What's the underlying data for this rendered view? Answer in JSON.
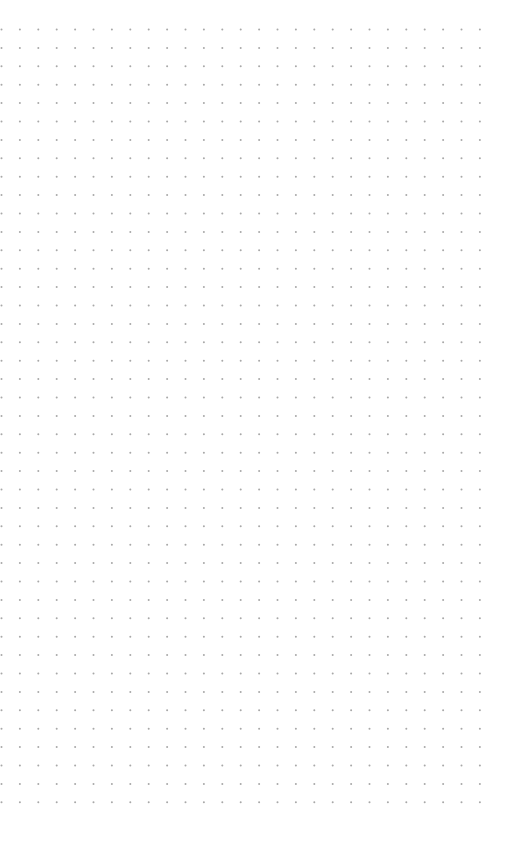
{
  "canvas": {
    "background": "#ffffff",
    "grid": {
      "dot_color": "#a8a8a8",
      "dot_radius": 1,
      "origin_x": 1.5,
      "origin_y": 29.5,
      "spacing_x": 18.4,
      "spacing_y": 18.4,
      "columns": 27,
      "rows": 43
    }
  }
}
